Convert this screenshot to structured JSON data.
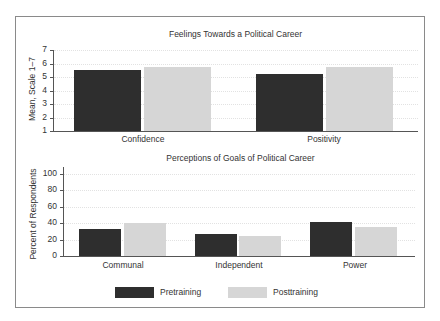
{
  "colors": {
    "pretraining": "#2e2e2e",
    "posttraining": "#d6d6d6",
    "frame": "#8a8a8a",
    "axis": "#555555"
  },
  "legend": [
    {
      "label": "Pretraining",
      "color": "#2e2e2e"
    },
    {
      "label": "Posttraining",
      "color": "#d6d6d6"
    }
  ],
  "chart_data": [
    {
      "type": "bar",
      "title": "Feelings Towards a Political Career",
      "xlabel": "",
      "ylabel": "Mean, Scale 1–7",
      "ylim": [
        1,
        7
      ],
      "yticks": [
        "1",
        "2",
        "3",
        "4",
        "5",
        "6",
        "7"
      ],
      "grid": true,
      "categories": [
        "Confidence",
        "Positivity"
      ],
      "series": [
        {
          "name": "Pretraining",
          "values": [
            5.5,
            5.25
          ]
        },
        {
          "name": "Posttraining",
          "values": [
            5.75,
            5.75
          ]
        }
      ],
      "legend_position": "bottom"
    },
    {
      "type": "bar",
      "title": "Perceptions of Goals of Political Career",
      "xlabel": "",
      "ylabel": "Percent of Respondents",
      "ylim": [
        0,
        100
      ],
      "yticks": [
        "0",
        "20",
        "40",
        "60",
        "80",
        "100"
      ],
      "grid": true,
      "categories": [
        "Communal",
        "Independent",
        "Power"
      ],
      "series": [
        {
          "name": "Pretraining",
          "values": [
            33,
            27,
            41
          ]
        },
        {
          "name": "Posttraining",
          "values": [
            40,
            25,
            35
          ]
        }
      ],
      "legend_position": "bottom"
    }
  ]
}
